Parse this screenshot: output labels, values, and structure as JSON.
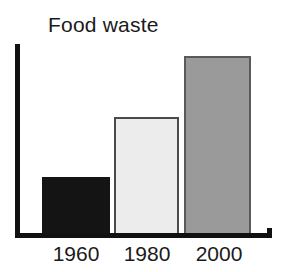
{
  "chart_data": {
    "type": "bar",
    "title": "Food waste",
    "xlabel": "",
    "ylabel": "",
    "categories": [
      "1960",
      "1980",
      "2000"
    ],
    "values": [
      1,
      2,
      3
    ],
    "series": [
      {
        "name": "Food waste",
        "values": [
          1,
          2,
          3
        ]
      }
    ],
    "bar_colors": [
      "#141414",
      "#ececec",
      "#9a9a9a"
    ],
    "bar_edge_colors": [
      "#141414",
      "#4a4a4a",
      "#5a5a5a"
    ],
    "ylim": [
      0,
      3.2
    ],
    "grid": false,
    "legend": null,
    "annotations": [],
    "axis_color": "#111111",
    "background_color": "#ffffff"
  },
  "chart": {
    "title": "Food waste",
    "bars": [
      {
        "label": "1960",
        "value": 1,
        "fill": "#141414"
      },
      {
        "label": "1980",
        "value": 2,
        "fill": "#ececec"
      },
      {
        "label": "2000",
        "value": 3,
        "fill": "#9a9a9a"
      }
    ]
  }
}
